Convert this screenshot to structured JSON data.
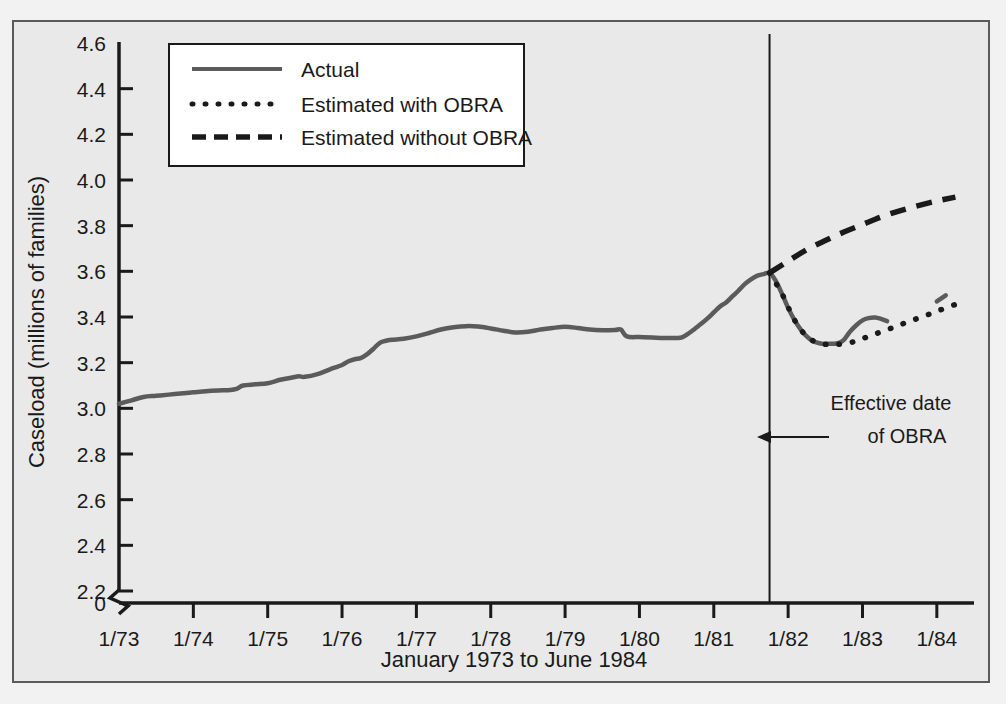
{
  "chart_data": {
    "type": "line",
    "title": "",
    "xlabel": "January 1973 to June 1984",
    "ylabel": "Caseload (millions of families)",
    "xlim": [
      1973.0,
      1984.5
    ],
    "ylim": [
      2.2,
      4.6
    ],
    "y_axis_break": true,
    "y_break_label": "0",
    "grid": false,
    "legend_position": "top-left-inside",
    "xticks": [
      "1/73",
      "1/74",
      "1/75",
      "1/76",
      "1/77",
      "1/78",
      "1/79",
      "1/80",
      "1/81",
      "1/82",
      "1/83",
      "1/84"
    ],
    "xtick_values": [
      1973,
      1974,
      1975,
      1976,
      1977,
      1978,
      1979,
      1980,
      1981,
      1982,
      1983,
      1984
    ],
    "yticks": [
      "4.6",
      "4.4",
      "4.2",
      "4.0",
      "3.8",
      "3.6",
      "3.4",
      "3.2",
      "3.0",
      "2.8",
      "2.6",
      "2.4",
      "2.2"
    ],
    "ytick_values": [
      4.6,
      4.4,
      4.2,
      4.0,
      3.8,
      3.6,
      3.4,
      3.2,
      3.0,
      2.8,
      2.6,
      2.4,
      2.2
    ],
    "annotations": [
      {
        "name": "obra-effective-date",
        "line1": "Effective date",
        "line2": "of OBRA",
        "x_value": 1981.75,
        "marker": "vertical-line-with-left-arrow"
      }
    ],
    "series": [
      {
        "name": "Actual",
        "style": "solid",
        "color": "#5b5b5b",
        "points": [
          [
            1973.0,
            3.02
          ],
          [
            1973.17,
            3.035
          ],
          [
            1973.33,
            3.05
          ],
          [
            1973.5,
            3.055
          ],
          [
            1973.67,
            3.06
          ],
          [
            1973.83,
            3.065
          ],
          [
            1974.0,
            3.07
          ],
          [
            1974.17,
            3.075
          ],
          [
            1974.33,
            3.078
          ],
          [
            1974.5,
            3.08
          ],
          [
            1974.58,
            3.085
          ],
          [
            1974.67,
            3.1
          ],
          [
            1974.83,
            3.105
          ],
          [
            1975.0,
            3.11
          ],
          [
            1975.17,
            3.125
          ],
          [
            1975.33,
            3.135
          ],
          [
            1975.42,
            3.14
          ],
          [
            1975.5,
            3.138
          ],
          [
            1975.67,
            3.15
          ],
          [
            1975.83,
            3.17
          ],
          [
            1976.0,
            3.19
          ],
          [
            1976.08,
            3.205
          ],
          [
            1976.17,
            3.215
          ],
          [
            1976.25,
            3.22
          ],
          [
            1976.33,
            3.235
          ],
          [
            1976.42,
            3.26
          ],
          [
            1976.5,
            3.285
          ],
          [
            1976.58,
            3.295
          ],
          [
            1976.67,
            3.3
          ],
          [
            1976.83,
            3.305
          ],
          [
            1977.0,
            3.315
          ],
          [
            1977.17,
            3.33
          ],
          [
            1977.33,
            3.345
          ],
          [
            1977.5,
            3.355
          ],
          [
            1977.67,
            3.36
          ],
          [
            1977.83,
            3.358
          ],
          [
            1978.0,
            3.35
          ],
          [
            1978.17,
            3.34
          ],
          [
            1978.33,
            3.332
          ],
          [
            1978.5,
            3.335
          ],
          [
            1978.67,
            3.345
          ],
          [
            1978.83,
            3.352
          ],
          [
            1979.0,
            3.357
          ],
          [
            1979.17,
            3.352
          ],
          [
            1979.33,
            3.345
          ],
          [
            1979.5,
            3.342
          ],
          [
            1979.67,
            3.343
          ],
          [
            1979.75,
            3.345
          ],
          [
            1979.83,
            3.315
          ],
          [
            1980.0,
            3.312
          ],
          [
            1980.17,
            3.31
          ],
          [
            1980.33,
            3.308
          ],
          [
            1980.5,
            3.308
          ],
          [
            1980.58,
            3.312
          ],
          [
            1980.67,
            3.33
          ],
          [
            1980.75,
            3.35
          ],
          [
            1980.83,
            3.37
          ],
          [
            1980.92,
            3.395
          ],
          [
            1981.0,
            3.42
          ],
          [
            1981.08,
            3.445
          ],
          [
            1981.17,
            3.465
          ],
          [
            1981.25,
            3.49
          ],
          [
            1981.33,
            3.515
          ],
          [
            1981.42,
            3.545
          ],
          [
            1981.5,
            3.565
          ],
          [
            1981.58,
            3.58
          ],
          [
            1981.67,
            3.588
          ],
          [
            1981.75,
            3.593
          ],
          [
            1981.83,
            3.56
          ],
          [
            1981.92,
            3.5
          ],
          [
            1982.0,
            3.44
          ],
          [
            1982.08,
            3.39
          ],
          [
            1982.17,
            3.345
          ],
          [
            1982.25,
            3.315
          ],
          [
            1982.33,
            3.295
          ],
          [
            1982.42,
            3.285
          ],
          [
            1982.5,
            3.282
          ],
          [
            1982.58,
            3.283
          ],
          [
            1982.67,
            3.285
          ],
          [
            1982.75,
            3.3
          ],
          [
            1982.83,
            3.335
          ],
          [
            1982.92,
            3.365
          ],
          [
            1983.0,
            3.385
          ],
          [
            1983.08,
            3.395
          ],
          [
            1983.17,
            3.398
          ],
          [
            1983.25,
            3.392
          ],
          [
            1983.33,
            3.382
          ]
        ]
      },
      {
        "name": "Estimated with OBRA",
        "style": "dotted",
        "color": "#1a1a1a",
        "points": [
          [
            1981.75,
            3.593
          ],
          [
            1981.92,
            3.5
          ],
          [
            1982.08,
            3.39
          ],
          [
            1982.25,
            3.315
          ],
          [
            1982.42,
            3.285
          ],
          [
            1982.58,
            3.28
          ],
          [
            1982.75,
            3.283
          ],
          [
            1982.92,
            3.295
          ],
          [
            1983.08,
            3.315
          ],
          [
            1983.25,
            3.335
          ],
          [
            1983.42,
            3.355
          ],
          [
            1983.58,
            3.375
          ],
          [
            1983.75,
            3.395
          ],
          [
            1983.92,
            3.415
          ],
          [
            1984.08,
            3.435
          ],
          [
            1984.25,
            3.455
          ]
        ]
      },
      {
        "name": "Estimated without OBRA",
        "style": "dashed",
        "color": "#1a1a1a",
        "points": [
          [
            1981.75,
            3.593
          ],
          [
            1982.0,
            3.645
          ],
          [
            1982.25,
            3.695
          ],
          [
            1982.5,
            3.735
          ],
          [
            1982.75,
            3.772
          ],
          [
            1983.0,
            3.805
          ],
          [
            1983.25,
            3.838
          ],
          [
            1983.5,
            3.865
          ],
          [
            1983.75,
            3.888
          ],
          [
            1984.0,
            3.908
          ],
          [
            1984.25,
            3.925
          ]
        ]
      },
      {
        "name": "Actual tail segment",
        "style": "solid",
        "color": "#5b5b5b",
        "points": [
          [
            1984.0,
            3.468
          ],
          [
            1984.12,
            3.495
          ]
        ]
      }
    ],
    "legend": [
      {
        "label": "Actual",
        "style": "solid"
      },
      {
        "label": "Estimated with OBRA",
        "style": "dotted"
      },
      {
        "label": "Estimated without OBRA",
        "style": "dashed"
      }
    ]
  }
}
